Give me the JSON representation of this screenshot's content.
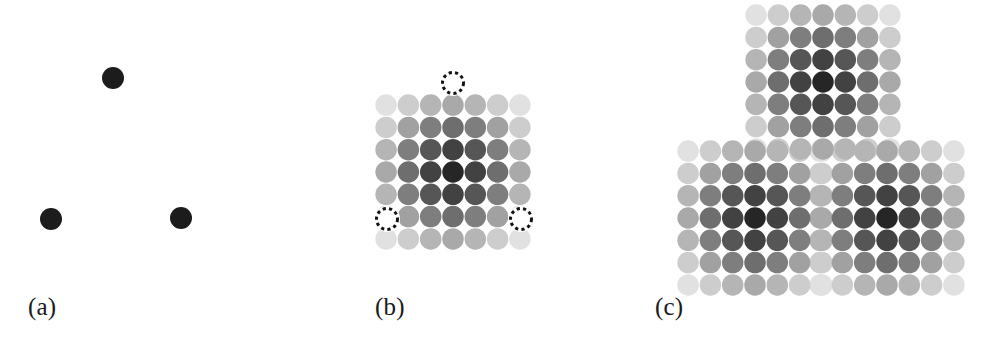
{
  "figure": {
    "width": 991,
    "height": 339,
    "background": "#ffffff",
    "caption_font_color": "#1a1a1a"
  },
  "chart_data": {
    "type": "scatter",
    "title": "",
    "subtitle": "",
    "xlabel": "",
    "ylabel": "",
    "grid": false,
    "legend_position": "none",
    "panels": [
      {
        "id": "a",
        "label": "(a)",
        "label_x": 28,
        "label_y": 294,
        "origin_x": 0,
        "width": 330,
        "kind": "points",
        "point_color": "#1c1c1c",
        "point_diameter": 22,
        "points": [
          {
            "name": "top",
            "x": 113,
            "y": 78
          },
          {
            "name": "bottom-left",
            "x": 51,
            "y": 219
          },
          {
            "name": "bottom-right",
            "x": 181,
            "y": 218
          }
        ]
      },
      {
        "id": "b",
        "label": "(b)",
        "label_x": 375,
        "label_y": 294,
        "origin_x": 330,
        "width": 330,
        "kind": "kernel",
        "kernel_rows": 7,
        "kernel_cols": 7,
        "cell_spacing": 22.3,
        "dot_diameter": 21.5,
        "kernel_center": {
          "x": 453,
          "y": 172
        },
        "markers": [
          {
            "name": "top",
            "x": 453,
            "y": 83,
            "diameter": 23
          },
          {
            "name": "bottom-left",
            "x": 387,
            "y": 219,
            "diameter": 23
          },
          {
            "name": "bottom-right",
            "x": 521,
            "y": 219,
            "diameter": 23
          }
        ],
        "marker_style": "dashed-outline",
        "marker_color": "#141414"
      },
      {
        "id": "c",
        "label": "(c)",
        "label_x": 655,
        "label_y": 294,
        "origin_x": 660,
        "width": 331,
        "kind": "kernel-sum",
        "kernel_rows": 7,
        "kernel_cols": 7,
        "cell_spacing": 22.3,
        "dot_diameter": 21.5,
        "kernel_centers": [
          {
            "name": "top",
            "x": 823,
            "y": 82
          },
          {
            "name": "bottom-left",
            "x": 755,
            "y": 218
          },
          {
            "name": "bottom-right",
            "x": 887,
            "y": 218
          }
        ]
      }
    ],
    "kernel_weights": [
      [
        0.06,
        0.16,
        0.28,
        0.34,
        0.28,
        0.16,
        0.06
      ],
      [
        0.16,
        0.38,
        0.56,
        0.64,
        0.56,
        0.38,
        0.16
      ],
      [
        0.28,
        0.56,
        0.76,
        0.86,
        0.76,
        0.56,
        0.28
      ],
      [
        0.34,
        0.64,
        0.86,
        1.0,
        0.86,
        0.64,
        0.34
      ],
      [
        0.28,
        0.56,
        0.76,
        0.86,
        0.76,
        0.56,
        0.28
      ],
      [
        0.16,
        0.38,
        0.56,
        0.64,
        0.56,
        0.38,
        0.16
      ],
      [
        0.06,
        0.16,
        0.28,
        0.34,
        0.28,
        0.16,
        0.06
      ]
    ],
    "grayscale_ramp": {
      "min_weight_color": "#ededed",
      "max_weight_color": "#262626",
      "note": "dot fill = lerp(min_weight_color -> max_weight_color) by accumulated weight, clamped at 1.0"
    }
  }
}
